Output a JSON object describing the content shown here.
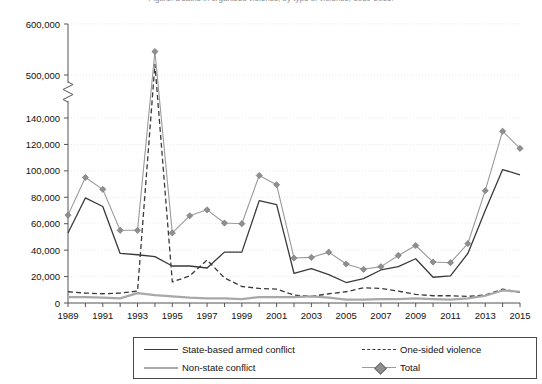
{
  "caption": "Figure: Deaths in organized violence, by type of violence, 1989-2015.",
  "chart_data": {
    "type": "line",
    "title": "",
    "xlabel": "",
    "ylabel": "",
    "x": [
      1989,
      1990,
      1991,
      1992,
      1993,
      1994,
      1995,
      1996,
      1997,
      1998,
      1999,
      2000,
      2001,
      2002,
      2003,
      2004,
      2005,
      2006,
      2007,
      2008,
      2009,
      2010,
      2011,
      2012,
      2013,
      2014,
      2015
    ],
    "tick_labels_x": [
      "1989",
      "1991",
      "1993",
      "1995",
      "1997",
      "1999",
      "2001",
      "2003",
      "2005",
      "2007",
      "2009",
      "2011",
      "2013",
      "2015"
    ],
    "tick_labels_y": [
      "0",
      "20,000",
      "40,000",
      "60,000",
      "80,000",
      "100,000",
      "120,000",
      "140,000",
      "500,000",
      "600,000"
    ],
    "ylim_lower": [
      0,
      140000
    ],
    "ylim_upper": [
      480000,
      600000
    ],
    "axis_break": true,
    "axis_break_note": "Y-axis broken between 140,000 and 500,000",
    "grid": true,
    "legend_position": "bottom",
    "series": [
      {
        "name": "State-based armed conflict",
        "style": "solid-dark",
        "color": "#3a3a3a",
        "values": [
          53000,
          79500,
          73000,
          37500,
          36500,
          144000,
          28000,
          28000,
          26500,
          38500,
          38500,
          77500,
          74500,
          22500,
          26000,
          21500,
          15500,
          18500,
          25000,
          27500,
          33500,
          19500,
          20500,
          37500,
          70000,
          101000,
          97000
        ]
      },
      {
        "name": "One-sided violence",
        "style": "dashed",
        "color": "#3a3a3a",
        "values": [
          8500,
          7500,
          7000,
          7500,
          9000,
          521000,
          16000,
          20500,
          32500,
          19000,
          12500,
          11000,
          10500,
          6000,
          5000,
          7000,
          8500,
          11500,
          11000,
          9000,
          6500,
          5500,
          5500,
          5000,
          6000,
          10500,
          8000
        ]
      },
      {
        "name": "Non-state conflict",
        "style": "solid-gray",
        "color": "#a8a8a8",
        "values": [
          4500,
          4500,
          4000,
          3500,
          7500,
          6000,
          5000,
          4000,
          3500,
          3500,
          3000,
          4500,
          4500,
          4500,
          5000,
          4000,
          2500,
          2500,
          3000,
          3000,
          3500,
          3000,
          2500,
          3500,
          5500,
          9500,
          8500
        ]
      },
      {
        "name": "Total",
        "style": "marker-diamond",
        "color": "#8f8f8f",
        "values": [
          66500,
          95000,
          86000,
          55000,
          55000,
          546000,
          53000,
          66000,
          70500,
          60500,
          60000,
          96500,
          89500,
          34000,
          34500,
          38500,
          29500,
          25500,
          27500,
          36000,
          43500,
          31000,
          30500,
          45000,
          85000,
          130000,
          117000
        ]
      }
    ]
  },
  "legend": {
    "items": [
      {
        "label": "State-based armed conflict",
        "style": "solid-dark"
      },
      {
        "label": "One-sided violence",
        "style": "dashed"
      },
      {
        "label": "Non-state conflict",
        "style": "solid-gray"
      },
      {
        "label": "Total",
        "style": "marker-diamond"
      }
    ]
  }
}
